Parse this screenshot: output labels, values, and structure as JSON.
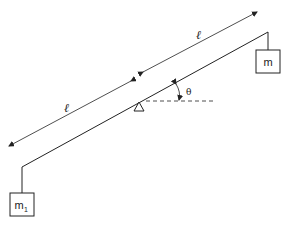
{
  "diagram": {
    "type": "physics-lever",
    "beam": {
      "from": [
        22,
        167
      ],
      "to": [
        268,
        32
      ]
    },
    "pivot": {
      "x": 139,
      "y": 102
    },
    "angle_label": "θ",
    "length_labels": [
      "ℓ",
      "ℓ"
    ],
    "masses": {
      "right": {
        "label": "m"
      },
      "left": {
        "label": "m",
        "subscript": "1"
      }
    },
    "colors": {
      "line": "#222222",
      "background": "#ffffff"
    }
  }
}
